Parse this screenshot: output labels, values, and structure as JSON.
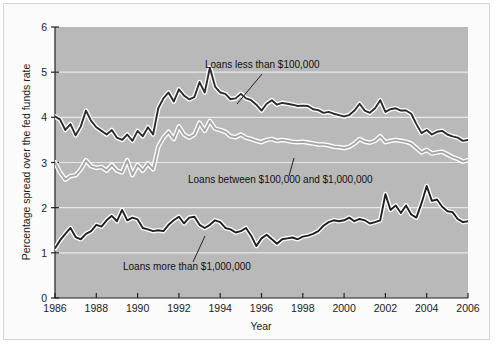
{
  "chart_data": {
    "type": "line",
    "title": "",
    "xlabel": "Year",
    "ylabel": "Percentage spread over the fed funds rate",
    "xlim": [
      1986,
      2006
    ],
    "ylim": [
      0,
      6
    ],
    "grid": "horizontal-white-gridlines",
    "legend": "inline-annotations",
    "x_ticks": [
      "1986",
      "1988",
      "1990",
      "1992",
      "1994",
      "1996",
      "1998",
      "2000",
      "2002",
      "2004",
      "2006"
    ],
    "y_ticks": [
      "0",
      "1",
      "2",
      "3",
      "4",
      "5",
      "6"
    ],
    "plot_background": "#b9b9b9",
    "gridline_color": "#e8e8e8",
    "series": [
      {
        "name": "Loans less than $100,000",
        "color": "#2b2b2b",
        "halo": "#ffffff",
        "annotation_label": "Loans less than $100,000",
        "x": [
          1986.0,
          1986.25,
          1986.5,
          1986.75,
          1987.0,
          1987.25,
          1987.5,
          1987.75,
          1988.0,
          1988.25,
          1988.5,
          1988.75,
          1989.0,
          1989.25,
          1989.5,
          1989.75,
          1990.0,
          1990.25,
          1990.5,
          1990.75,
          1991.0,
          1991.25,
          1991.5,
          1991.75,
          1992.0,
          1992.25,
          1992.5,
          1992.75,
          1993.0,
          1993.25,
          1993.5,
          1993.75,
          1994.0,
          1994.25,
          1994.5,
          1994.75,
          1995.0,
          1995.25,
          1995.5,
          1995.75,
          1996.0,
          1996.25,
          1996.5,
          1996.75,
          1997.0,
          1997.25,
          1997.5,
          1997.75,
          1998.0,
          1998.25,
          1998.5,
          1998.75,
          1999.0,
          1999.25,
          1999.5,
          1999.75,
          2000.0,
          2000.25,
          2000.5,
          2000.75,
          2001.0,
          2001.25,
          2001.5,
          2001.75,
          2002.0,
          2002.25,
          2002.5,
          2002.75,
          2003.0,
          2003.25,
          2003.5,
          2003.75,
          2004.0,
          2004.25,
          2004.5,
          2004.75,
          2005.0,
          2005.25,
          2005.5,
          2005.75,
          2006.0
        ],
        "values": [
          4.02,
          3.95,
          3.72,
          3.85,
          3.6,
          3.8,
          4.15,
          3.92,
          3.78,
          3.7,
          3.62,
          3.72,
          3.55,
          3.5,
          3.62,
          3.48,
          3.7,
          3.58,
          3.78,
          3.62,
          4.2,
          4.42,
          4.55,
          4.35,
          4.62,
          4.48,
          4.4,
          4.45,
          4.78,
          4.55,
          5.1,
          4.68,
          4.55,
          4.52,
          4.4,
          4.42,
          4.52,
          4.42,
          4.38,
          4.28,
          4.15,
          4.3,
          4.38,
          4.28,
          4.32,
          4.3,
          4.28,
          4.25,
          4.26,
          4.25,
          4.18,
          4.16,
          4.1,
          4.12,
          4.08,
          4.05,
          4.02,
          4.05,
          4.15,
          4.3,
          4.15,
          4.1,
          4.2,
          4.38,
          4.12,
          4.18,
          4.2,
          4.15,
          4.15,
          4.08,
          3.85,
          3.65,
          3.72,
          3.62,
          3.68,
          3.7,
          3.62,
          3.58,
          3.55,
          3.48,
          3.5
        ]
      },
      {
        "name": "Loans between $100,000 and $1,000,000",
        "color": "#a6a6a6",
        "halo": "#ffffff",
        "annotation_label": "Loans between $100,000 and $1,000,000",
        "x": [
          1986.0,
          1986.25,
          1986.5,
          1986.75,
          1987.0,
          1987.25,
          1987.5,
          1987.75,
          1988.0,
          1988.25,
          1988.5,
          1988.75,
          1989.0,
          1989.25,
          1989.5,
          1989.75,
          1990.0,
          1990.25,
          1990.5,
          1990.75,
          1991.0,
          1991.25,
          1991.5,
          1991.75,
          1992.0,
          1992.25,
          1992.5,
          1992.75,
          1993.0,
          1993.25,
          1993.5,
          1993.75,
          1994.0,
          1994.25,
          1994.5,
          1994.75,
          1995.0,
          1995.25,
          1995.5,
          1995.75,
          1996.0,
          1996.25,
          1996.5,
          1996.75,
          1997.0,
          1997.25,
          1997.5,
          1997.75,
          1998.0,
          1998.25,
          1998.5,
          1998.75,
          1999.0,
          1999.25,
          1999.5,
          1999.75,
          2000.0,
          2000.25,
          2000.5,
          2000.75,
          2001.0,
          2001.25,
          2001.5,
          2001.75,
          2002.0,
          2002.25,
          2002.5,
          2002.75,
          2003.0,
          2003.25,
          2003.5,
          2003.75,
          2004.0,
          2004.25,
          2004.5,
          2004.75,
          2005.0,
          2005.25,
          2005.5,
          2005.75,
          2006.0
        ],
        "values": [
          3.0,
          2.78,
          2.62,
          2.7,
          2.72,
          2.85,
          3.05,
          2.92,
          2.88,
          2.9,
          2.82,
          2.95,
          2.82,
          2.78,
          3.05,
          2.72,
          2.95,
          2.82,
          2.98,
          2.85,
          3.35,
          3.55,
          3.68,
          3.52,
          3.8,
          3.62,
          3.55,
          3.62,
          3.88,
          3.7,
          3.92,
          3.75,
          3.72,
          3.68,
          3.58,
          3.56,
          3.62,
          3.55,
          3.52,
          3.48,
          3.45,
          3.5,
          3.52,
          3.48,
          3.5,
          3.48,
          3.46,
          3.45,
          3.46,
          3.44,
          3.42,
          3.4,
          3.4,
          3.38,
          3.35,
          3.34,
          3.32,
          3.35,
          3.42,
          3.52,
          3.46,
          3.44,
          3.48,
          3.58,
          3.45,
          3.48,
          3.5,
          3.48,
          3.46,
          3.42,
          3.32,
          3.22,
          3.28,
          3.2,
          3.22,
          3.24,
          3.18,
          3.12,
          3.08,
          3.02,
          3.05
        ]
      },
      {
        "name": "Loans more than $1,000,000",
        "color": "#1f1f1f",
        "halo": "#ffffff",
        "annotation_label": "Loans more than $1,000,000",
        "x": [
          1986.0,
          1986.25,
          1986.5,
          1986.75,
          1987.0,
          1987.25,
          1987.5,
          1987.75,
          1988.0,
          1988.25,
          1988.5,
          1988.75,
          1989.0,
          1989.25,
          1989.5,
          1989.75,
          1990.0,
          1990.25,
          1990.5,
          1990.75,
          1991.0,
          1991.25,
          1991.5,
          1991.75,
          1992.0,
          1992.25,
          1992.5,
          1992.75,
          1993.0,
          1993.25,
          1993.5,
          1993.75,
          1994.0,
          1994.25,
          1994.5,
          1994.75,
          1995.0,
          1995.25,
          1995.5,
          1995.75,
          1996.0,
          1996.25,
          1996.5,
          1996.75,
          1997.0,
          1997.25,
          1997.5,
          1997.75,
          1998.0,
          1998.25,
          1998.5,
          1998.75,
          1999.0,
          1999.25,
          1999.5,
          1999.75,
          2000.0,
          2000.25,
          2000.5,
          2000.75,
          2001.0,
          2001.25,
          2001.5,
          2001.75,
          2002.0,
          2002.25,
          2002.5,
          2002.75,
          2003.0,
          2003.25,
          2003.5,
          2003.75,
          2004.0,
          2004.25,
          2004.5,
          2004.75,
          2005.0,
          2005.25,
          2005.5,
          2005.75,
          2006.0
        ],
        "values": [
          1.1,
          1.28,
          1.42,
          1.55,
          1.35,
          1.3,
          1.42,
          1.48,
          1.62,
          1.58,
          1.72,
          1.82,
          1.7,
          1.95,
          1.72,
          1.78,
          1.74,
          1.55,
          1.52,
          1.48,
          1.5,
          1.48,
          1.62,
          1.72,
          1.8,
          1.65,
          1.78,
          1.8,
          1.62,
          1.55,
          1.62,
          1.72,
          1.68,
          1.55,
          1.52,
          1.45,
          1.48,
          1.55,
          1.38,
          1.15,
          1.32,
          1.4,
          1.3,
          1.2,
          1.3,
          1.32,
          1.34,
          1.3,
          1.36,
          1.38,
          1.42,
          1.48,
          1.6,
          1.68,
          1.72,
          1.7,
          1.72,
          1.78,
          1.7,
          1.75,
          1.72,
          1.65,
          1.68,
          1.72,
          2.3,
          1.95,
          2.05,
          1.88,
          2.05,
          1.85,
          1.78,
          2.1,
          2.48,
          2.15,
          2.18,
          2.02,
          1.92,
          1.9,
          1.75,
          1.68,
          1.7
        ]
      }
    ],
    "annotations": [
      {
        "text": "Loans less than $100,000",
        "text_x": 205,
        "text_y": 68,
        "leader_from_x": 262,
        "leader_from_y": 74,
        "leader_to_x": 237,
        "leader_to_y": 104
      },
      {
        "text": "Loans between $100,000 and $1,000,000",
        "text_x": 188,
        "text_y": 183,
        "leader_from_x": 289,
        "leader_from_y": 176,
        "leader_to_x": 294,
        "leader_to_y": 158
      },
      {
        "text": "Loans more than $1,000,000",
        "text_x": 123,
        "text_y": 270,
        "leader_from_x": 193,
        "leader_from_y": 262,
        "leader_to_x": 205,
        "leader_to_y": 236
      }
    ]
  },
  "axes": {
    "y_title": "Percentage spread over the fed funds rate",
    "x_title": "Year",
    "y_tick_labels": [
      "6",
      "5",
      "4",
      "3",
      "2",
      "1",
      "0"
    ],
    "x_tick_labels": [
      "1986",
      "1988",
      "1990",
      "1992",
      "1994",
      "1996",
      "1998",
      "2000",
      "2002",
      "2004",
      "2006"
    ]
  }
}
